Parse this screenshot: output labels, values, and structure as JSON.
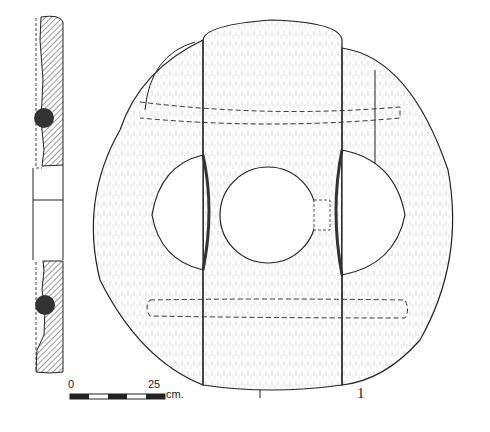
{
  "figure": {
    "figure_number": "1",
    "scale_bar": {
      "start_label": "0",
      "end_label": "25",
      "unit": "cm.",
      "segments": 5
    },
    "views": [
      "section",
      "face"
    ],
    "colors": {
      "ink": "#222222",
      "hatch": "#555555",
      "paper": "#ffffff",
      "dowel": "#333333"
    }
  }
}
